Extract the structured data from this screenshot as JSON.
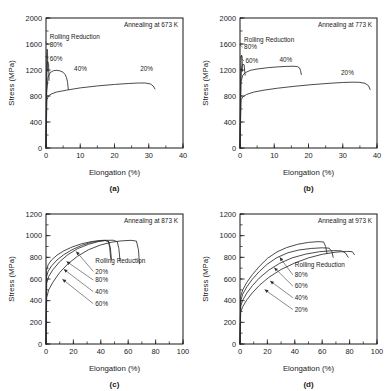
{
  "figure": {
    "type": "multi-panel-line-chart",
    "panel_count": 4,
    "layout": "2x2-grid"
  },
  "chart_data": [
    {
      "type": "line",
      "panel": "a",
      "subcaption": "(a)",
      "title": "Annealing at 673 K",
      "xlabel": "Elongation (%)",
      "ylabel": "Stress (MPa)",
      "xlim": [
        0,
        40
      ],
      "ylim": [
        0,
        2000
      ],
      "xticks": [
        0,
        10,
        20,
        30,
        40
      ],
      "xtick_labels": [
        "0",
        "10",
        "20",
        "30",
        "40"
      ],
      "yticks": [
        0,
        400,
        800,
        1200,
        1600,
        2000
      ],
      "ytick_labels": [
        "0",
        "400",
        "800",
        "1200",
        "1600",
        "2000"
      ],
      "x_minor_step": 5,
      "y_minor_step": 200,
      "grid": false,
      "legend_position": "in-plot-annotations",
      "legend_title": "Rolling Reduction",
      "series": [
        {
          "name": "80%",
          "label": "80%",
          "label_x": 1.1,
          "label_y": 1560,
          "points": [
            [
              0,
              0
            ],
            [
              0.12,
              900
            ],
            [
              0.22,
              1430
            ],
            [
              0.32,
              1520
            ],
            [
              0.45,
              1470
            ],
            [
              0.52,
              1180
            ]
          ]
        },
        {
          "name": "60%",
          "label": "60%",
          "label_x": 1.1,
          "label_y": 1340,
          "points": [
            [
              0,
              0
            ],
            [
              0.15,
              880
            ],
            [
              0.3,
              1270
            ],
            [
              0.5,
              1330
            ],
            [
              0.75,
              1300
            ],
            [
              0.9,
              1040
            ]
          ]
        },
        {
          "name": "40%",
          "label": "40%",
          "label_x": 8.2,
          "label_y": 1180,
          "points": [
            [
              0,
              0
            ],
            [
              0.2,
              850
            ],
            [
              0.6,
              1090
            ],
            [
              1.2,
              1160
            ],
            [
              2.2,
              1190
            ],
            [
              3.2,
              1195
            ],
            [
              4.2,
              1185
            ],
            [
              5.0,
              1165
            ],
            [
              5.6,
              1130
            ],
            [
              6.0,
              1080
            ],
            [
              6.3,
              1010
            ],
            [
              6.5,
              900
            ]
          ]
        },
        {
          "name": "20%",
          "label": "20%",
          "label_x": 27.5,
          "label_y": 1180,
          "points": [
            [
              0,
              0
            ],
            [
              0.25,
              740
            ],
            [
              0.7,
              800
            ],
            [
              1.5,
              830
            ],
            [
              3,
              860
            ],
            [
              6,
              890
            ],
            [
              10,
              925
            ],
            [
              15,
              955
            ],
            [
              20,
              978
            ],
            [
              24,
              992
            ],
            [
              27,
              1000
            ],
            [
              29,
              1000
            ],
            [
              30.5,
              985
            ],
            [
              31.3,
              955
            ],
            [
              31.8,
              910
            ]
          ]
        }
      ]
    },
    {
      "type": "line",
      "panel": "b",
      "subcaption": "(b)",
      "title": "Annealing at 773 K",
      "xlabel": "Elongation (%)",
      "ylabel": "Stress (MPa)",
      "xlim": [
        0,
        40
      ],
      "ylim": [
        0,
        2000
      ],
      "xticks": [
        0,
        10,
        20,
        30,
        40
      ],
      "xtick_labels": [
        "0",
        "10",
        "20",
        "30",
        "40"
      ],
      "yticks": [
        0,
        400,
        800,
        1200,
        1600,
        2000
      ],
      "ytick_labels": [
        "0",
        "400",
        "800",
        "1200",
        "1600",
        "2000"
      ],
      "x_minor_step": 5,
      "y_minor_step": 200,
      "grid": false,
      "legend_position": "in-plot-annotations",
      "legend_title": "Rolling Reduction",
      "series": [
        {
          "name": "80%",
          "label": "80%",
          "label_x": 1.2,
          "label_y": 1520,
          "points": [
            [
              0,
              0
            ],
            [
              0.15,
              1000
            ],
            [
              0.3,
              1390
            ],
            [
              0.45,
              1430
            ],
            [
              0.6,
              1390
            ],
            [
              0.7,
              1180
            ]
          ]
        },
        {
          "name": "60%",
          "label": "60%",
          "label_x": 1.6,
          "label_y": 1310,
          "points": [
            [
              0,
              0
            ],
            [
              0.2,
              980
            ],
            [
              0.45,
              1240
            ],
            [
              0.8,
              1290
            ],
            [
              1.2,
              1280
            ],
            [
              1.5,
              1120
            ]
          ]
        },
        {
          "name": "40%",
          "label": "40%",
          "label_x": 11.5,
          "label_y": 1330,
          "points": [
            [
              0,
              0
            ],
            [
              0.3,
              1020
            ],
            [
              0.8,
              1120
            ],
            [
              1.6,
              1160
            ],
            [
              3,
              1195
            ],
            [
              5,
              1215
            ],
            [
              8,
              1235
            ],
            [
              11,
              1248
            ],
            [
              13.5,
              1255
            ],
            [
              15.5,
              1258
            ],
            [
              16.8,
              1252
            ],
            [
              17.4,
              1230
            ],
            [
              17.7,
              1190
            ],
            [
              17.9,
              1130
            ]
          ]
        },
        {
          "name": "20%",
          "label": "20%",
          "label_x": 29.5,
          "label_y": 1120,
          "points": [
            [
              0,
              0
            ],
            [
              0.3,
              740
            ],
            [
              0.9,
              790
            ],
            [
              2,
              825
            ],
            [
              4,
              860
            ],
            [
              7,
              890
            ],
            [
              11,
              920
            ],
            [
              16,
              950
            ],
            [
              21,
              975
            ],
            [
              26,
              995
            ],
            [
              30,
              1008
            ],
            [
              33,
              1013
            ],
            [
              35,
              1010
            ],
            [
              36.5,
              995
            ],
            [
              37.5,
              960
            ],
            [
              38,
              900
            ]
          ]
        }
      ]
    },
    {
      "type": "line",
      "panel": "c",
      "subcaption": "(c)",
      "title": "Annealing at 873 K",
      "xlabel": "Elongation (%)",
      "ylabel": "Stress (MPa)",
      "xlim": [
        0,
        100
      ],
      "ylim": [
        0,
        1200
      ],
      "xticks": [
        0,
        20,
        40,
        60,
        80,
        100
      ],
      "xtick_labels": [
        "0",
        "20",
        "40",
        "60",
        "80",
        "100"
      ],
      "yticks": [
        0,
        200,
        400,
        600,
        800,
        1000,
        1200
      ],
      "ytick_labels": [
        "0",
        "200",
        "400",
        "600",
        "800",
        "1000",
        "1200"
      ],
      "x_minor_step": 10,
      "y_minor_step": 100,
      "grid": false,
      "legend_position": "in-plot-annotations",
      "legend_title": "Rolling Reduction",
      "label_order": [
        "20%",
        "80%",
        "40%",
        "60%"
      ],
      "series": [
        {
          "name": "20%",
          "label": "20%",
          "label_x": 36,
          "label_y": 650,
          "arrow_to_x": 22,
          "arrow_to_y": 855,
          "points": [
            [
              0,
              0
            ],
            [
              0.5,
              430
            ],
            [
              2,
              500
            ],
            [
              5,
              570
            ],
            [
              10,
              660
            ],
            [
              16,
              740
            ],
            [
              23,
              810
            ],
            [
              31,
              870
            ],
            [
              40,
              915
            ],
            [
              48,
              940
            ],
            [
              55,
              952
            ],
            [
              62,
              957
            ],
            [
              66,
              950
            ],
            [
              67.5,
              870
            ],
            [
              68.2,
              740
            ]
          ]
        },
        {
          "name": "80%",
          "label": "80%",
          "label_x": 36,
          "label_y": 570,
          "arrow_to_x": 15,
          "arrow_to_y": 762,
          "points": [
            [
              0,
              0
            ],
            [
              0.4,
              680
            ],
            [
              1.5,
              730
            ],
            [
              4,
              775
            ],
            [
              8,
              820
            ],
            [
              13,
              860
            ],
            [
              19,
              895
            ],
            [
              26,
              925
            ],
            [
              33,
              945
            ],
            [
              39,
              955
            ],
            [
              43,
              958
            ],
            [
              45.5,
              950
            ],
            [
              46.5,
              890
            ],
            [
              47.2,
              790
            ]
          ]
        },
        {
          "name": "40%",
          "label": "40%",
          "label_x": 36,
          "label_y": 462,
          "arrow_to_x": 13,
          "arrow_to_y": 690,
          "points": [
            [
              0,
              0
            ],
            [
              0.5,
              560
            ],
            [
              2,
              625
            ],
            [
              5,
              685
            ],
            [
              10,
              760
            ],
            [
              16,
              825
            ],
            [
              23,
              880
            ],
            [
              31,
              920
            ],
            [
              38,
              945
            ],
            [
              44,
              957
            ],
            [
              49,
              958
            ],
            [
              52,
              945
            ],
            [
              53.2,
              880
            ],
            [
              54,
              770
            ]
          ]
        },
        {
          "name": "60%",
          "label": "60%",
          "label_x": 36,
          "label_y": 352,
          "arrow_to_x": 12,
          "arrow_to_y": 598,
          "points": [
            [
              0,
              0
            ],
            [
              0.4,
              620
            ],
            [
              1.6,
              672
            ],
            [
              4,
              720
            ],
            [
              8,
              775
            ],
            [
              13,
              825
            ],
            [
              19,
              870
            ],
            [
              26,
              910
            ],
            [
              33,
              938
            ],
            [
              39,
              952
            ],
            [
              43,
              955
            ],
            [
              45.8,
              946
            ],
            [
              47,
              885
            ],
            [
              47.8,
              775
            ]
          ]
        }
      ]
    },
    {
      "type": "line",
      "panel": "d",
      "subcaption": "(d)",
      "title": "Annealing at 973 K",
      "xlabel": "Elongation (%)",
      "ylabel": "Stress (MPa)",
      "xlim": [
        0,
        100
      ],
      "ylim": [
        0,
        1200
      ],
      "xticks": [
        0,
        20,
        40,
        60,
        80,
        100
      ],
      "xtick_labels": [
        "0",
        "20",
        "40",
        "60",
        "80",
        "100"
      ],
      "yticks": [
        0,
        200,
        400,
        600,
        800,
        1000,
        1200
      ],
      "ytick_labels": [
        "0",
        "200",
        "400",
        "600",
        "800",
        "1000",
        "1200"
      ],
      "x_minor_step": 10,
      "y_minor_step": 100,
      "grid": false,
      "legend_position": "in-plot-annotations",
      "legend_title": "Rolling Reduction",
      "label_order": [
        "80%",
        "60%",
        "40%",
        "20%"
      ],
      "series": [
        {
          "name": "80%",
          "label": "80%",
          "label_x": 40,
          "label_y": 618,
          "arrow_to_x": 29,
          "arrow_to_y": 800,
          "points": [
            [
              0,
              0
            ],
            [
              0.5,
              440
            ],
            [
              2,
              500
            ],
            [
              5,
              570
            ],
            [
              9,
              640
            ],
            [
              14,
              715
            ],
            [
              20,
              790
            ],
            [
              27,
              850
            ],
            [
              34,
              890
            ],
            [
              42,
              920
            ],
            [
              50,
              938
            ],
            [
              57,
              945
            ],
            [
              61,
              942
            ],
            [
              62.5,
              900
            ],
            [
              63.5,
              835
            ]
          ]
        },
        {
          "name": "60%",
          "label": "60%",
          "label_x": 40,
          "label_y": 515,
          "arrow_to_x": 25,
          "arrow_to_y": 705,
          "points": [
            [
              0,
              0
            ],
            [
              0.5,
              400
            ],
            [
              2,
              460
            ],
            [
              5,
              528
            ],
            [
              9,
              598
            ],
            [
              14,
              668
            ],
            [
              20,
              738
            ],
            [
              27,
              798
            ],
            [
              35,
              842
            ],
            [
              43,
              868
            ],
            [
              52,
              882
            ],
            [
              60,
              888
            ],
            [
              65,
              885
            ],
            [
              67,
              855
            ],
            [
              68,
              800
            ]
          ]
        },
        {
          "name": "40%",
          "label": "40%",
          "label_x": 40,
          "label_y": 408,
          "arrow_to_x": 22,
          "arrow_to_y": 582,
          "points": [
            [
              0,
              0
            ],
            [
              0.5,
              350
            ],
            [
              2,
              405
            ],
            [
              5,
              470
            ],
            [
              9,
              538
            ],
            [
              14,
              608
            ],
            [
              21,
              682
            ],
            [
              29,
              745
            ],
            [
              38,
              795
            ],
            [
              48,
              830
            ],
            [
              58,
              852
            ],
            [
              68,
              862
            ],
            [
              74,
              860
            ],
            [
              77,
              840
            ],
            [
              79,
              800
            ]
          ]
        },
        {
          "name": "20%",
          "label": "20%",
          "label_x": 40,
          "label_y": 298,
          "arrow_to_x": 18,
          "arrow_to_y": 502,
          "points": [
            [
              0,
              0
            ],
            [
              0.5,
              295
            ],
            [
              2,
              345
            ],
            [
              5,
              408
            ],
            [
              9,
              472
            ],
            [
              14,
              540
            ],
            [
              21,
              615
            ],
            [
              30,
              688
            ],
            [
              40,
              748
            ],
            [
              50,
              795
            ],
            [
              60,
              828
            ],
            [
              70,
              848
            ],
            [
              78,
              855
            ],
            [
              82,
              852
            ],
            [
              83.5,
              825
            ]
          ]
        }
      ]
    }
  ]
}
